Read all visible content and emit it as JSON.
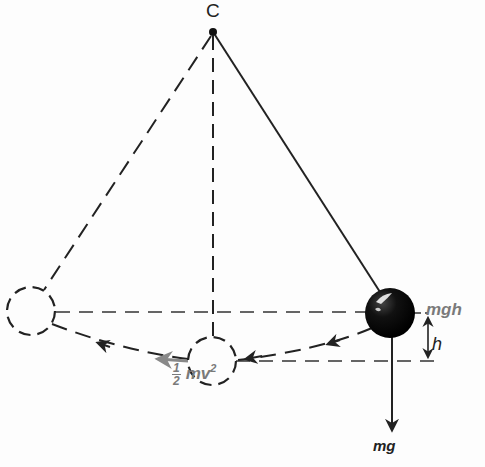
{
  "diagram": {
    "type": "pendulum energy diagram",
    "pivot": {
      "label": "C",
      "x": 213,
      "y": 32
    },
    "bob_positions": [
      {
        "name": "left-extreme",
        "x": 31,
        "y": 311,
        "style": "dashed"
      },
      {
        "name": "bottom",
        "x": 212,
        "y": 361,
        "style": "dashed"
      },
      {
        "name": "right-extreme",
        "x": 390,
        "y": 313,
        "style": "solid-filled"
      }
    ],
    "labels": {
      "pivot": "C",
      "potential_energy": "mgh",
      "height": "h",
      "weight": "mg",
      "kinetic_energy_fraction_num": "1",
      "kinetic_energy_fraction_den": "2",
      "kinetic_energy_body": "mv",
      "kinetic_energy_exp": "2"
    },
    "colors": {
      "line": "#222222",
      "label_gray": "#7a7a7a",
      "motion_arrow": "#888888",
      "bob_fill": "#0a0a0a"
    }
  }
}
